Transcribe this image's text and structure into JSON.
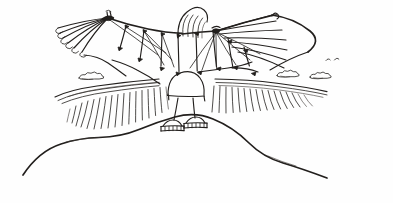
{
  "artwork": {
    "title": "Winged Figure on a Hill",
    "medium": "pen and ink line drawing",
    "subject": "person wearing large fan-ribbed ornithopter wings standing on a hilltop",
    "background_color": "#fefefe",
    "ink_color": "#221f1d",
    "canvas": {
      "width": 393,
      "height": 203
    }
  },
  "scene": {
    "sky": {
      "clouds": [
        {
          "name": "cloud-left",
          "x": 90,
          "y": 76
        },
        {
          "name": "cloud-right-inner",
          "x": 288,
          "y": 73
        },
        {
          "name": "cloud-right-outer",
          "x": 323,
          "y": 75
        }
      ],
      "birds": [
        {
          "name": "bird-mark-1",
          "x": 330,
          "y": 59
        },
        {
          "name": "bird-mark-2",
          "x": 340,
          "y": 58
        }
      ]
    },
    "figure": {
      "body_shape": "dome",
      "crest": {
        "name": "head-crest",
        "stroke_count": 5
      },
      "feet": [
        {
          "name": "foot-left",
          "x": 172,
          "y": 124
        },
        {
          "name": "foot-right",
          "x": 196,
          "y": 121
        }
      ]
    },
    "wings": {
      "left": {
        "fan_ribs": 6,
        "strut_nodes": 5
      },
      "right": {
        "fan_ribs": 7,
        "strut_nodes": 5
      }
    },
    "terrain": {
      "far_ridge_hatch_lines": 34,
      "foreground_hill": "single sweeping curve peaking beneath the figure"
    }
  },
  "chart_data": {
    "type": "scatter",
    "xlabel": "",
    "ylabel": "",
    "categories": [
      "cloud-left",
      "cloud-right-inner",
      "cloud-right-outer",
      "bird-mark-1",
      "bird-mark-2",
      "foot-left",
      "foot-right"
    ],
    "values": [
      76,
      73,
      75,
      59,
      58,
      124,
      121
    ],
    "x": [
      90,
      288,
      323,
      330,
      340,
      172,
      196
    ],
    "xlim": [
      0,
      393
    ],
    "ylim": [
      0,
      203
    ],
    "grid": false,
    "legend": "none"
  }
}
